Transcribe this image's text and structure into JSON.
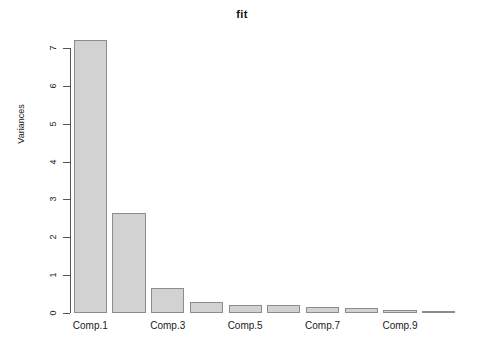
{
  "chart_data": {
    "type": "bar",
    "title": "fit",
    "xlabel": "",
    "ylabel": "Variances",
    "categories": [
      "Comp.1",
      "Comp.2",
      "Comp.3",
      "Comp.4",
      "Comp.5",
      "Comp.6",
      "Comp.7",
      "Comp.8",
      "Comp.9",
      "Comp.10"
    ],
    "values": [
      7.2,
      2.65,
      0.66,
      0.28,
      0.22,
      0.22,
      0.17,
      0.12,
      0.07,
      0.03
    ],
    "ylim": [
      0,
      7.45
    ],
    "yticks": [
      0,
      1,
      2,
      3,
      4,
      5,
      6,
      7
    ],
    "ytick_labels": [
      "0",
      "1",
      "2",
      "3",
      "4",
      "5",
      "6",
      "7"
    ],
    "xtick_labels": [
      "Comp.1",
      "Comp.3",
      "Comp.5",
      "Comp.7",
      "Comp.9"
    ],
    "xtick_categories": [
      "Comp.1",
      "Comp.3",
      "Comp.5",
      "Comp.7",
      "Comp.9"
    ],
    "grid": false,
    "legend": false,
    "bar_fill_color": "#d2d2d2",
    "bar_border_color": "#8c8c8c",
    "axis_color": "#555555",
    "background_color": "#ffffff"
  }
}
